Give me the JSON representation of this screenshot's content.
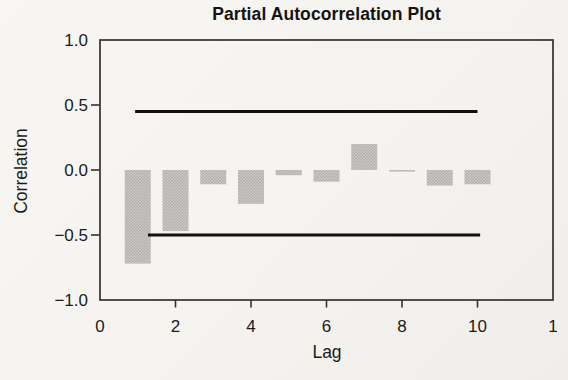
{
  "chart_data": {
    "type": "bar",
    "title": "Partial Autocorrelation Plot",
    "xlabel": "Lag",
    "ylabel": "Correlation",
    "xlim": [
      0,
      12
    ],
    "ylim": [
      -1.0,
      1.0
    ],
    "grid": false,
    "legend": "none",
    "x_ticks": [
      {
        "value": 0,
        "label": "0"
      },
      {
        "value": 2,
        "label": "2"
      },
      {
        "value": 4,
        "label": "4"
      },
      {
        "value": 6,
        "label": "6"
      },
      {
        "value": 8,
        "label": "8"
      },
      {
        "value": 10,
        "label": "10"
      },
      {
        "value": 12,
        "label": "1"
      }
    ],
    "y_ticks": [
      {
        "value": 1.0,
        "label": "1.0"
      },
      {
        "value": 0.5,
        "label": "0.5"
      },
      {
        "value": 0.0,
        "label": "0.0"
      },
      {
        "value": -0.5,
        "label": "−0.5"
      },
      {
        "value": -1.0,
        "label": "−1.0"
      }
    ],
    "lags": [
      1,
      2,
      3,
      4,
      5,
      6,
      7,
      8,
      9,
      10
    ],
    "values": [
      -0.72,
      -0.47,
      -0.11,
      -0.26,
      -0.04,
      -0.09,
      0.2,
      -0.01,
      -0.12,
      -0.11
    ],
    "confidence_bands": {
      "upper": {
        "value": 0.45,
        "lag_start": 0.93,
        "lag_end": 10.0
      },
      "lower": {
        "value": -0.5,
        "lag_start": 1.27,
        "lag_end": 10.07
      }
    },
    "bar_color_base": "#ccc9c6",
    "bar_color_dot": "#b0aeab",
    "band_line_color": "#121110",
    "axis_color": "#33322f",
    "text_color": "#1c1b19",
    "background_color": "#f4f3ef"
  }
}
